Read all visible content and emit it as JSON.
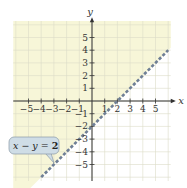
{
  "chart_data": {
    "type": "inequality-graph",
    "title": "",
    "xlabel": "x",
    "ylabel": "y",
    "xlim": [
      -6,
      6
    ],
    "ylim": [
      -6,
      6
    ],
    "x_ticks": [
      -5,
      -4,
      -3,
      -2,
      -1,
      1,
      2,
      3,
      4,
      5
    ],
    "y_ticks": [
      5,
      4,
      3,
      2,
      1,
      -1,
      -2,
      -3,
      -4,
      -5
    ],
    "x_tick_labels": [
      "−5",
      "−4",
      "−3",
      "−2",
      "−1",
      "1",
      "2",
      "3",
      "4",
      "5"
    ],
    "y_tick_labels": [
      "5",
      "4",
      "3",
      "2",
      "1",
      "−1",
      "−2",
      "−3",
      "−4",
      "−5"
    ],
    "grid": true,
    "boundary_line": {
      "equation": "x − y = 2",
      "slope": 1,
      "intercept": -2,
      "style": "dashed",
      "color": "#6f7f95",
      "from": [
        -4,
        -6
      ],
      "to": [
        6,
        4
      ]
    },
    "shaded_region": {
      "description": "x − y < 2 (above the line)",
      "color": "#f7f6d8"
    },
    "callout": {
      "label": "x − y = 2",
      "lhs": "x − y = ",
      "rhs": "2",
      "color": "#c9d9e2"
    }
  },
  "colors": {
    "shade": "#f7f6d8",
    "grid_shaded": "#e2e0bc",
    "grid_unshaded": "#e0e3e8",
    "axis": "#333333",
    "line": "#6f7f95",
    "callout_fill": "#cfdde6",
    "callout_stroke": "#8a9aa6"
  }
}
